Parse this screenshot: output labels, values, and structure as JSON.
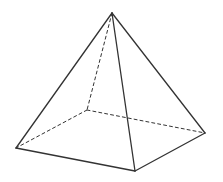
{
  "diagram": {
    "type": "square-pyramid",
    "stroke_color": "#333333",
    "vertices": {
      "apex": [
        112,
        13
      ],
      "left": [
        16,
        148
      ],
      "front": [
        135,
        171
      ],
      "right": [
        205,
        133
      ],
      "back": [
        87,
        110
      ]
    },
    "solid_edges": [
      [
        "apex",
        "left"
      ],
      [
        "apex",
        "front"
      ],
      [
        "apex",
        "right"
      ],
      [
        "left",
        "front"
      ],
      [
        "front",
        "right"
      ]
    ],
    "dashed_edges": [
      [
        "apex",
        "back"
      ],
      [
        "back",
        "left"
      ],
      [
        "back",
        "right"
      ]
    ]
  }
}
